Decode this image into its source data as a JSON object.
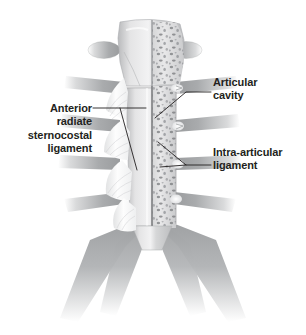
{
  "figure": {
    "background_color": "#ffffff",
    "label_color": "#231f20"
  },
  "labels": [
    {
      "id": "anterior-radiate-sternocostal-ligament",
      "text": "Anterior\nradiate\nsternocostal\nligament",
      "align": "right"
    },
    {
      "id": "articular-cavity",
      "text": "Articular\ncavity",
      "align": "left"
    },
    {
      "id": "intra-articular-ligament",
      "text": "Intra-articular\nligament",
      "align": "left"
    }
  ],
  "anatomy": {
    "parts": [
      "manubrium",
      "sternal-body",
      "xiphoid-process",
      "costal-cartilage",
      "spongy-bone",
      "radiate-ligament-fan",
      "articular-cavity",
      "intra-articular-ligament"
    ],
    "section_note": "left half intact cortical bone, right half cut showing trabecular bone",
    "colors": {
      "bone_light": "#e9e9ea",
      "bone_mid": "#c9cacb",
      "bone_shadow": "#8e9092",
      "cartilage": "#a7a9ab",
      "ligament_white": "#fbfbfc",
      "trabecular_speck": "#6e7073",
      "leader_line": "#231f20"
    }
  }
}
